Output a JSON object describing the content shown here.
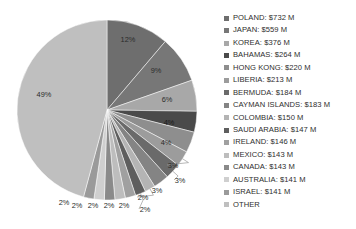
{
  "chart_data": {
    "type": "pie",
    "title": "",
    "categories": [
      "POLAND",
      "JAPAN",
      "KOREA",
      "BAHAMAS",
      "HONG KONG",
      "LIBERIA",
      "BERMUDA",
      "CAYMAN ISLANDS",
      "COLOMBIA",
      "SAUDI ARABIA",
      "IRELAND",
      "MEXICO",
      "CANADA",
      "AUSTRALIA",
      "ISRAEL",
      "OTHER"
    ],
    "values": [
      732,
      559,
      376,
      264,
      220,
      213,
      184,
      183,
      150,
      147,
      146,
      143,
      143,
      141,
      141,
      2970
    ],
    "percent_labels": [
      "12%",
      "9%",
      "6%",
      "4%",
      "4%",
      "3%",
      "3%",
      "3%",
      "2%",
      "2%",
      "2%",
      "2%",
      "2%",
      "2%",
      "2%",
      "49%"
    ],
    "percents": [
      12,
      9,
      6,
      4,
      4,
      3,
      3,
      3,
      2,
      2,
      2,
      2,
      2,
      2,
      2,
      49
    ],
    "unit": "$ M",
    "start_angle_deg": 0,
    "direction": "clockwise",
    "legend_position": "right",
    "grid": false,
    "colors": [
      "#6e6e6e",
      "#777777",
      "#a8a8a8",
      "#4a4a4a",
      "#8e8e8e",
      "#9c9c9c",
      "#6a6a6a",
      "#848484",
      "#b4b4b4",
      "#5e5e5e",
      "#a0a0a0",
      "#bdbdbd",
      "#8a8a8a",
      "#cfcfcf",
      "#9a9a9a",
      "#bfbfbf"
    ]
  },
  "legend": {
    "items": [
      {
        "label": "POLAND: $732 M",
        "color": "#6e6e6e"
      },
      {
        "label": "JAPAN: $559 M",
        "color": "#777777"
      },
      {
        "label": "KOREA: $376 M",
        "color": "#a8a8a8"
      },
      {
        "label": "BAHAMAS: $264 M",
        "color": "#4a4a4a"
      },
      {
        "label": "HONG KONG: $220 M",
        "color": "#8e8e8e"
      },
      {
        "label": "LIBERIA: $213 M",
        "color": "#9c9c9c"
      },
      {
        "label": "BERMUDA: $184 M",
        "color": "#6a6a6a"
      },
      {
        "label": "CAYMAN ISLANDS: $183 M",
        "color": "#848484"
      },
      {
        "label": "COLOMBIA: $150 M",
        "color": "#b4b4b4"
      },
      {
        "label": "SAUDI ARABIA: $147 M",
        "color": "#5e5e5e"
      },
      {
        "label": "IRELAND: $146 M",
        "color": "#a0a0a0"
      },
      {
        "label": "MEXICO: $143 M",
        "color": "#bdbdbd"
      },
      {
        "label": "CANADA: $143 M",
        "color": "#8a8a8a"
      },
      {
        "label": "AUSTRALIA: $141 M",
        "color": "#cfcfcf"
      },
      {
        "label": "ISRAEL: $141 M",
        "color": "#9a9a9a"
      },
      {
        "label": "OTHER",
        "color": "#bfbfbf"
      }
    ]
  }
}
